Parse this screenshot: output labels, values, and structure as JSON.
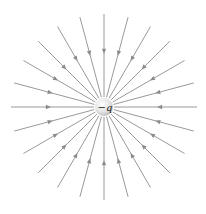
{
  "diagram": {
    "charge": {
      "label": "−q",
      "sign": "negative",
      "center": [
        104,
        107
      ],
      "radius": 9,
      "fill_light": "#ffffff",
      "fill_dark": "#b8b8b8"
    },
    "field_lines": {
      "count": 24,
      "angular_spacing_deg": 15,
      "inner_radius": 10,
      "outer_radius": 93,
      "arrow_direction": "inward",
      "arrow_position_fraction": 0.55,
      "color": "#9a9a9a"
    }
  }
}
